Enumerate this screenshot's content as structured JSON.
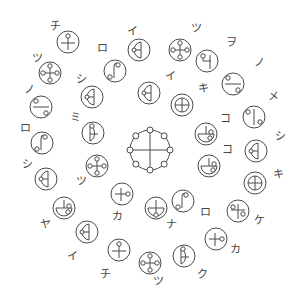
{
  "diagram": {
    "title": "",
    "stroke_color": "#4a4a4a",
    "background": "#ffffff",
    "center": {
      "x": 150,
      "y": 150,
      "r": 20,
      "node_count": 8,
      "description": "central ring with cross and 8 small nodes"
    },
    "symbols": [
      {
        "label": "チ",
        "cx": 68,
        "cy": 42,
        "lx": 50,
        "ly": 30,
        "glyph": "cross-top-dot"
      },
      {
        "label": "ツ",
        "cx": 50,
        "cy": 73,
        "lx": 32,
        "ly": 62,
        "glyph": "four-dot-cross"
      },
      {
        "label": "ノ",
        "cx": 41,
        "cy": 107,
        "lx": 24,
        "ly": 93,
        "glyph": "bar-two-dots"
      },
      {
        "label": "ロ",
        "cx": 42,
        "cy": 143,
        "lx": 20,
        "ly": 132,
        "glyph": "hook"
      },
      {
        "label": "シ",
        "cx": 46,
        "cy": 179,
        "lx": 22,
        "ly": 168,
        "glyph": "half-d"
      },
      {
        "label": "ヤ",
        "cx": 64,
        "cy": 208,
        "lx": 40,
        "ly": 228,
        "glyph": "bowl-cross-dot"
      },
      {
        "label": "イ",
        "cx": 87,
        "cy": 232,
        "lx": 67,
        "ly": 260,
        "glyph": "half-d"
      },
      {
        "label": "チ",
        "cx": 119,
        "cy": 250,
        "lx": 100,
        "ly": 278,
        "glyph": "cross-top-dot"
      },
      {
        "label": "ツ",
        "cx": 150,
        "cy": 263,
        "lx": 153,
        "ly": 285,
        "glyph": "four-dot-cross"
      },
      {
        "label": "ク",
        "cx": 184,
        "cy": 256,
        "lx": 197,
        "ly": 278,
        "glyph": "d-top-dot"
      },
      {
        "label": "カ",
        "cx": 216,
        "cy": 239,
        "lx": 230,
        "ly": 253,
        "glyph": "cross-right-dot"
      },
      {
        "label": "ケ",
        "cx": 238,
        "cy": 211,
        "lx": 254,
        "ly": 224,
        "glyph": "cross-two-dots"
      },
      {
        "label": "キ",
        "cx": 255,
        "cy": 183,
        "lx": 273,
        "ly": 178,
        "glyph": "circle-plus"
      },
      {
        "label": "シ",
        "cx": 256,
        "cy": 151,
        "lx": 275,
        "ly": 140,
        "glyph": "half-d"
      },
      {
        "label": "メ",
        "cx": 254,
        "cy": 117,
        "lx": 268,
        "ly": 100,
        "glyph": "vbar-two-dots"
      },
      {
        "label": "ノ",
        "cx": 233,
        "cy": 84,
        "lx": 254,
        "ly": 66,
        "glyph": "bar-two-dots"
      },
      {
        "label": "ヲ",
        "cx": 207,
        "cy": 61,
        "lx": 226,
        "ly": 46,
        "glyph": "wo-shape"
      },
      {
        "label": "ツ",
        "cx": 180,
        "cy": 50,
        "lx": 191,
        "ly": 32,
        "glyph": "four-dot-cross"
      },
      {
        "label": "イ",
        "cx": 139,
        "cy": 50,
        "lx": 127,
        "ly": 35,
        "glyph": "half-d"
      },
      {
        "label": "ロ",
        "cx": 115,
        "cy": 71,
        "lx": 97,
        "ly": 52,
        "glyph": "hook"
      },
      {
        "label": "シ",
        "cx": 92,
        "cy": 97,
        "lx": 76,
        "ly": 83,
        "glyph": "half-d"
      },
      {
        "label": "ミ",
        "cx": 93,
        "cy": 133,
        "lx": 70,
        "ly": 121,
        "glyph": "d-top-dot"
      },
      {
        "label": "ツ",
        "cx": 97,
        "cy": 166,
        "lx": 76,
        "ly": 185,
        "glyph": "four-dot-cross"
      },
      {
        "label": "カ",
        "cx": 122,
        "cy": 194,
        "lx": 112,
        "ly": 220,
        "glyph": "cross-right-dot"
      },
      {
        "label": "ナ",
        "cx": 156,
        "cy": 208,
        "lx": 166,
        "ly": 228,
        "glyph": "bowl-bottom-dot"
      },
      {
        "label": "ロ",
        "cx": 183,
        "cy": 201,
        "lx": 200,
        "ly": 216,
        "glyph": "hook"
      },
      {
        "label": "コ",
        "cx": 209,
        "cy": 166,
        "lx": 222,
        "ly": 153,
        "glyph": "bowl-cross-dot"
      },
      {
        "label": "コ",
        "cx": 206,
        "cy": 134,
        "lx": 220,
        "ly": 122,
        "glyph": "bowl-cross-dot"
      },
      {
        "label": "キ",
        "cx": 182,
        "cy": 105,
        "lx": 198,
        "ly": 92,
        "glyph": "circle-plus"
      },
      {
        "label": "イ",
        "cx": 149,
        "cy": 93,
        "lx": 165,
        "ly": 80,
        "glyph": "half-d"
      }
    ]
  }
}
